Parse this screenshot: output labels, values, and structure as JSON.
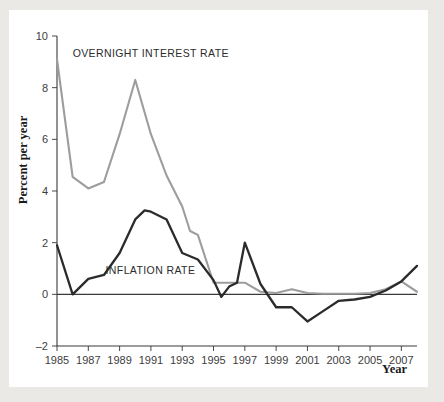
{
  "figure": {
    "background_color": "#ffffff",
    "page_color": "#ebe9e6"
  },
  "chart_data": {
    "type": "line",
    "title": "",
    "subtitle": "",
    "xlabel": "Year",
    "ylabel": "Percent per year",
    "xlim": [
      1985,
      2008
    ],
    "ylim": [
      -2,
      10
    ],
    "xticks": [
      1985,
      1987,
      1989,
      1991,
      1993,
      1995,
      1997,
      1999,
      2001,
      2003,
      2005,
      2007
    ],
    "xticklabels": [
      "1985",
      "1987",
      "1989",
      "1991",
      "1993",
      "1995",
      "1997",
      "1999",
      "2001",
      "2003",
      "2005",
      "2007"
    ],
    "yticks": [
      -2,
      0,
      2,
      4,
      6,
      8,
      10
    ],
    "yticklabels": [
      "–2",
      "0",
      "2",
      "4",
      "6",
      "8",
      "10"
    ],
    "grid": false,
    "legend_position": "inline-annotation",
    "zero_line": 0,
    "x": [
      1985,
      1986,
      1987,
      1988,
      1989,
      1990,
      1991,
      1992,
      1993,
      1994,
      1995,
      1996,
      1997,
      1998,
      1999,
      2000,
      2001,
      2002,
      2003,
      2004,
      2005,
      2006,
      2007,
      2008
    ],
    "series": [
      {
        "name": "OVERNIGHT INTEREST RATE",
        "color": "#9d9d9d",
        "width": 2.1,
        "label_x": 1987.1,
        "label_y": 9.15,
        "values": [
          9.1,
          4.55,
          4.1,
          4.35,
          6.2,
          8.3,
          6.2,
          4.6,
          3.4,
          2.45,
          2.3,
          0.45,
          0.45,
          0.35,
          0.05,
          0.15,
          0.05,
          0.02,
          0.02,
          0.02,
          0.02,
          0.1,
          0.5,
          0.1
        ]
      },
      {
        "name": "INFLATION RATE",
        "color": "#2b2b2b",
        "width": 2.3,
        "label_x": 1988.2,
        "label_y": 0.78,
        "values": [
          1.9,
          0.0,
          0.6,
          0.75,
          1.6,
          2.9,
          3.25,
          2.9,
          2.6,
          1.6,
          1.4,
          1.2,
          0.55,
          -0.1,
          0.3,
          0.55,
          2.0,
          0.4,
          -0.5,
          -0.5,
          -0.75,
          -1.05,
          -0.6,
          -0.35
        ]
      }
    ],
    "series_note": "black INFLATION RATE values are plotted over x 1985..2008 mapped by index"
  },
  "inflation_plot_points": [
    [
      1985,
      1.9
    ],
    [
      1986,
      0.0
    ],
    [
      1987,
      0.6
    ],
    [
      1988,
      0.75
    ],
    [
      1989,
      1.6
    ],
    [
      1990,
      2.9
    ],
    [
      1990.6,
      3.25
    ],
    [
      1991,
      3.2
    ],
    [
      1992,
      2.9
    ],
    [
      1993,
      1.6
    ],
    [
      1994,
      1.35
    ],
    [
      1995,
      0.55
    ],
    [
      1995.5,
      -0.1
    ],
    [
      1996,
      0.3
    ],
    [
      1996.5,
      0.45
    ],
    [
      1997,
      2.0
    ],
    [
      1998,
      0.4
    ],
    [
      1999,
      -0.5
    ],
    [
      2000,
      -0.5
    ],
    [
      2001,
      -1.05
    ],
    [
      2002,
      -0.65
    ],
    [
      2003,
      -0.25
    ],
    [
      2004,
      -0.2
    ],
    [
      2005,
      -0.1
    ],
    [
      2006,
      0.15
    ],
    [
      2007,
      0.5
    ],
    [
      2008,
      1.1
    ]
  ],
  "overnight_plot_points": [
    [
      1985,
      9.1
    ],
    [
      1986,
      4.55
    ],
    [
      1987,
      4.1
    ],
    [
      1988,
      4.35
    ],
    [
      1989,
      6.2
    ],
    [
      1990,
      8.3
    ],
    [
      1991,
      6.2
    ],
    [
      1992,
      4.6
    ],
    [
      1993,
      3.4
    ],
    [
      1993.5,
      2.45
    ],
    [
      1994,
      2.3
    ],
    [
      1995,
      0.45
    ],
    [
      1996,
      0.45
    ],
    [
      1997,
      0.45
    ],
    [
      1998,
      0.1
    ],
    [
      1999,
      0.05
    ],
    [
      2000,
      0.2
    ],
    [
      2001,
      0.05
    ],
    [
      2002,
      0.02
    ],
    [
      2003,
      0.02
    ],
    [
      2004,
      0.02
    ],
    [
      2005,
      0.05
    ],
    [
      2006,
      0.2
    ],
    [
      2007,
      0.5
    ],
    [
      2008,
      0.1
    ]
  ],
  "annotations": [
    {
      "name": "overnight-interest-rate-label",
      "text": "OVERNIGHT INTEREST RATE",
      "x": 1986.0,
      "y": 9.2
    },
    {
      "name": "inflation-rate-label",
      "text": "INFLATION RATE",
      "x": 1988.1,
      "y": 0.8
    }
  ]
}
